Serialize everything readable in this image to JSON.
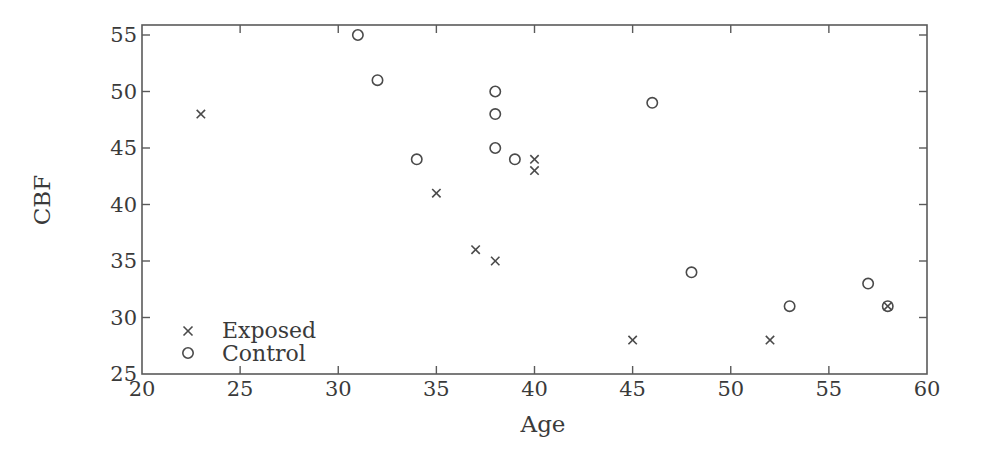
{
  "chart_data": {
    "type": "scatter",
    "title": "",
    "xlabel": "Age",
    "ylabel": "CBF",
    "xlim": [
      20,
      60
    ],
    "ylim": [
      25,
      55
    ],
    "xticks": [
      20,
      25,
      30,
      35,
      40,
      45,
      50,
      55,
      60
    ],
    "yticks": [
      25,
      30,
      35,
      40,
      45,
      50,
      55
    ],
    "grid": false,
    "legend_position": "lower left",
    "series": [
      {
        "name": "Exposed",
        "marker": "x",
        "points": [
          [
            23,
            48
          ],
          [
            35,
            41
          ],
          [
            37,
            36
          ],
          [
            38,
            35
          ],
          [
            40,
            44
          ],
          [
            40,
            43
          ],
          [
            45,
            28
          ],
          [
            52,
            28
          ],
          [
            58,
            31
          ]
        ]
      },
      {
        "name": "Control",
        "marker": "o",
        "points": [
          [
            31,
            55
          ],
          [
            32,
            51
          ],
          [
            34,
            44
          ],
          [
            38,
            50
          ],
          [
            38,
            48
          ],
          [
            38,
            45
          ],
          [
            39,
            44
          ],
          [
            46,
            49
          ],
          [
            48,
            34
          ],
          [
            53,
            31
          ],
          [
            57,
            33
          ],
          [
            58,
            31
          ]
        ]
      }
    ]
  },
  "legend": {
    "items": [
      {
        "label": "Exposed",
        "marker": "x"
      },
      {
        "label": "Control",
        "marker": "o"
      }
    ]
  },
  "axes": {
    "xlabel": "Age",
    "ylabel": "CBF"
  }
}
